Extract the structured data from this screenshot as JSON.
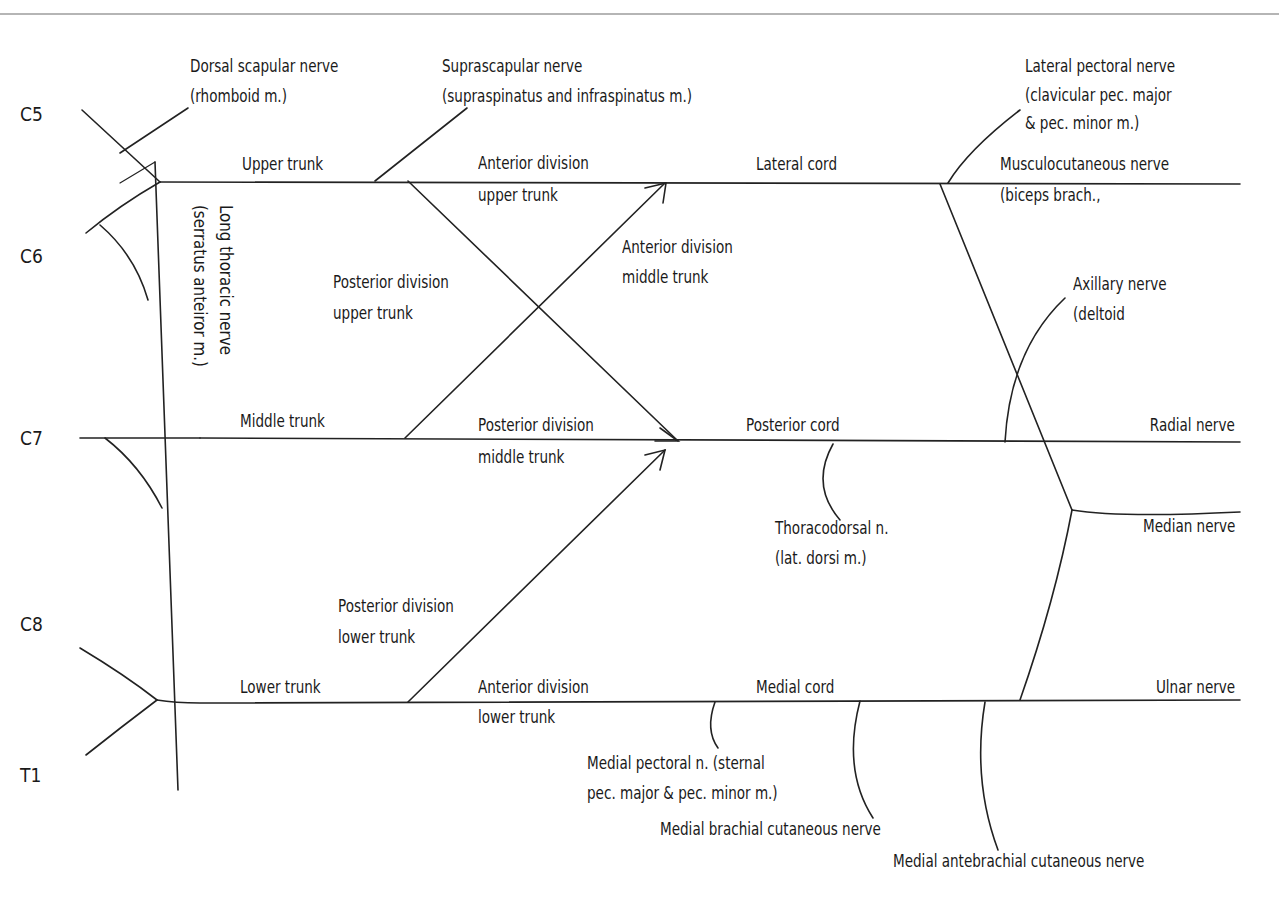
{
  "diagram": {
    "type": "brachial plexus schematic",
    "header_fragment": "p . . . y . . pp . . . . y",
    "roots": [
      {
        "id": "C5",
        "label": "C5"
      },
      {
        "id": "C6",
        "label": "C6"
      },
      {
        "id": "C7",
        "label": "C7"
      },
      {
        "id": "C8",
        "label": "C8"
      },
      {
        "id": "T1",
        "label": "T1"
      }
    ],
    "trunks": {
      "upper": "Upper trunk",
      "middle": "Middle trunk",
      "lower": "Lower trunk"
    },
    "divisions": {
      "ant_upper": [
        "Anterior division",
        "upper trunk"
      ],
      "post_upper": [
        "Posterior division",
        "upper trunk"
      ],
      "ant_middle": [
        "Anterior division",
        "middle trunk"
      ],
      "post_middle": [
        "Posterior division",
        "middle trunk"
      ],
      "post_lower": [
        "Posterior division",
        "lower trunk"
      ],
      "ant_lower": [
        "Anterior division",
        "lower trunk"
      ]
    },
    "cords": {
      "lateral": "Lateral cord",
      "posterior": "Posterior cord",
      "medial": "Medial cord"
    },
    "branches": {
      "dorsal_scapular": [
        "Dorsal scapular nerve",
        "(rhomboid m.)"
      ],
      "suprascapular": [
        "Suprascapular nerve",
        "(supraspinatus and infraspinatus m.)"
      ],
      "long_thoracic": [
        "Long thoracic nerve",
        "(serratus anteiror m.)"
      ],
      "lateral_pectoral": [
        "Lateral pectoral nerve",
        "(clavicular pec. major",
        "& pec. minor m.)"
      ],
      "musculocutaneous": [
        "Musculocutaneous nerve",
        "(biceps brach.,"
      ],
      "axillary": [
        "Axillary nerve",
        "(deltoid"
      ],
      "radial": "Radial nerve",
      "thoracodorsal": [
        "Thoracodorsal  n.",
        "(lat. dorsi m.)"
      ],
      "median": "Median nerve",
      "ulnar": "Ulnar nerve",
      "medial_pectoral": [
        "Medial pectoral n. (sternal",
        "pec. major & pec. minor m.)"
      ],
      "medial_brachial_cutaneous": "Medial brachial cutaneous nerve",
      "medial_antebrachial_cutaneous": "Medial antebrachial cutaneous nerve"
    },
    "colors": {
      "line": "#222222",
      "text": "#1a1a1a",
      "background": "#ffffff",
      "top_rule": "#b5b5b5"
    }
  }
}
